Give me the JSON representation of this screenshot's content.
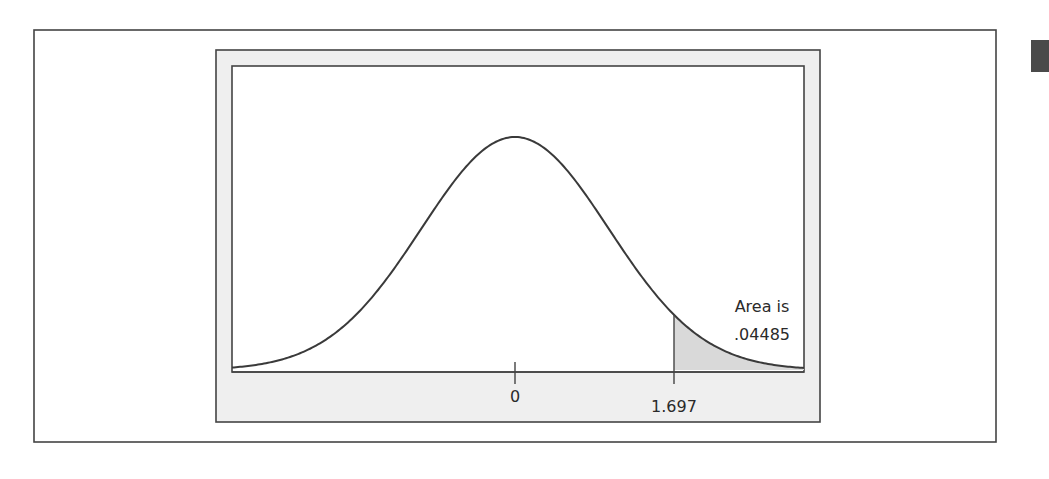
{
  "chart_data": {
    "type": "area",
    "title": "",
    "xlabel": "",
    "ylabel": "",
    "distribution": "t (approximately normal), centered at 0",
    "x_range": [
      -3.05,
      3.08
    ],
    "ticks": [
      {
        "value": 0,
        "label": "0"
      },
      {
        "value": 1.697,
        "label": "1.697"
      }
    ],
    "shaded_region": {
      "from": 1.697,
      "to": 3.08,
      "label_line1": "Area is",
      "label_line2": ".04485"
    },
    "grid": false,
    "legend": null
  },
  "annotation": {
    "line1": "Area is",
    "line2": ".04485"
  },
  "axis": {
    "tick_zero_label": "0",
    "tick_critical_label": "1.697"
  },
  "colors": {
    "curve": "#3a3a3a",
    "frame": "#444444",
    "panel_fill": "#efefef",
    "plot_fill": "#ffffff",
    "shade_fill": "#d9d9d9",
    "corner_mark": "#4a4a4a"
  }
}
